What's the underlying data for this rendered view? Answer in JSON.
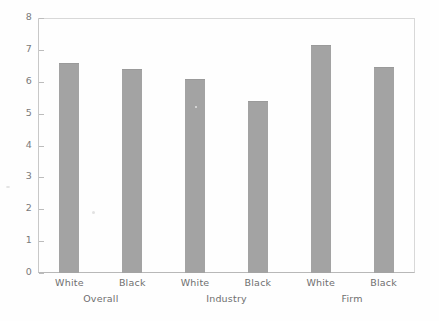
{
  "chart_data": {
    "type": "bar",
    "title": "",
    "subtitle": "",
    "xlabel": "",
    "ylabel": "",
    "ylim": [
      0,
      8
    ],
    "y_ticks": [
      "0",
      "1",
      "2",
      "3",
      "4",
      "5",
      "6",
      "7",
      "8"
    ],
    "grid": false,
    "legend": "none",
    "bar_color": "#a3a3a3",
    "categories": [
      "White",
      "Black",
      "White",
      "Black",
      "White",
      "Black"
    ],
    "values": [
      6.6,
      6.4,
      6.1,
      5.4,
      7.15,
      6.45
    ],
    "groups": [
      {
        "label": "Overall",
        "categories": [
          "White",
          "Black"
        ],
        "values": [
          6.6,
          6.4
        ]
      },
      {
        "label": "Industry",
        "categories": [
          "White",
          "Black"
        ],
        "values": [
          6.1,
          5.4
        ]
      },
      {
        "label": "Firm",
        "categories": [
          "White",
          "Black"
        ],
        "values": [
          7.15,
          6.45
        ]
      }
    ],
    "group_labels": [
      "Overall",
      "Industry",
      "Firm"
    ]
  }
}
